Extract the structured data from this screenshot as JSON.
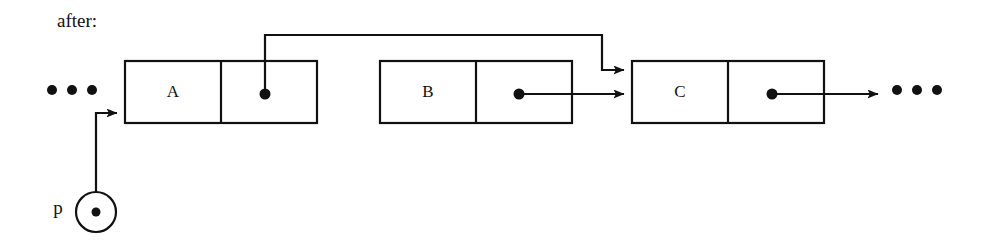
{
  "diagram": {
    "caption": "after:",
    "type": "singly-linked-list-pointer-diagram",
    "stroke_color": "#111111",
    "background_color": "#ffffff",
    "nodes": [
      {
        "id": "A",
        "label": "A",
        "x": 125,
        "y": 61,
        "width": 192,
        "height": 62,
        "divider_x": 221,
        "pointer_dot": {
          "x": 265,
          "y": 94
        }
      },
      {
        "id": "B",
        "label": "B",
        "x": 380,
        "y": 61,
        "width": 192,
        "height": 62,
        "divider_x": 476,
        "pointer_dot": {
          "x": 519,
          "y": 94
        }
      },
      {
        "id": "C",
        "label": "C",
        "x": 632,
        "y": 61,
        "width": 192,
        "height": 62,
        "divider_x": 728,
        "pointer_dot": {
          "x": 772,
          "y": 94
        }
      }
    ],
    "pointer_variable": {
      "name": "p",
      "label": "p",
      "circle": {
        "cx": 96,
        "cy": 212,
        "r": 20
      },
      "dot": {
        "cx": 96,
        "cy": 212,
        "r": 4
      },
      "label_position": {
        "x": 58,
        "y": 209
      },
      "target": "A"
    },
    "links": [
      {
        "id": "a-to-c",
        "from": "A",
        "to": "C",
        "routing": "up-over-down",
        "path": "M265,94 L265,35 L602,35 L602,70 L628,70"
      },
      {
        "id": "b-to-c",
        "from": "B",
        "to": "C",
        "routing": "straight",
        "path": "M519,94 L628,94"
      },
      {
        "id": "c-to-next",
        "from": "C",
        "to": "ellipsis-right",
        "routing": "straight",
        "path": "M772,94 L880,94"
      },
      {
        "id": "p-to-a",
        "from": "p",
        "to": "A",
        "routing": "up-right",
        "path": "M96,192 L96,113 L121,113"
      }
    ],
    "ellipsis_left": {
      "label": "...",
      "dots": [
        {
          "cx": 52,
          "cy": 90
        },
        {
          "cx": 72,
          "cy": 90
        },
        {
          "cx": 92,
          "cy": 90
        }
      ]
    },
    "ellipsis_right": {
      "label": "...",
      "dots": [
        {
          "cx": 897,
          "cy": 90
        },
        {
          "cx": 917,
          "cy": 90
        },
        {
          "cx": 937,
          "cy": 90
        }
      ]
    },
    "caption_position": {
      "x": 57,
      "y": 27
    }
  }
}
